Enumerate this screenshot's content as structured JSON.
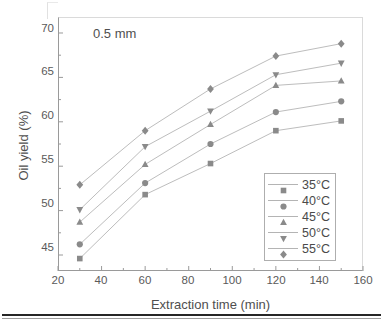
{
  "chart_data": {
    "type": "line",
    "title": "",
    "annotation": "0.5 mm",
    "xlabel": "Extraction time (min)",
    "ylabel": "Oil yield (%)",
    "xlim": [
      20,
      160
    ],
    "ylim": [
      43.2,
      71.8
    ],
    "xticks": [
      20,
      40,
      60,
      80,
      100,
      120,
      140,
      160
    ],
    "yticks": [
      45,
      50,
      55,
      60,
      65,
      70
    ],
    "xminor_step": 10,
    "yminor_step": 2.5,
    "grid": false,
    "legend_position": "lower right",
    "x": [
      30,
      60,
      90,
      120,
      150
    ],
    "series": [
      {
        "name": "35°C",
        "marker": "square",
        "color": "#8a8a8a",
        "values": [
          44.6,
          51.8,
          55.3,
          59.0,
          60.1
        ]
      },
      {
        "name": "40°C",
        "marker": "circle",
        "color": "#8a8a8a",
        "values": [
          46.2,
          53.1,
          57.5,
          61.1,
          62.3
        ]
      },
      {
        "name": "45°C",
        "marker": "triangle-up",
        "color": "#8a8a8a",
        "values": [
          48.7,
          55.2,
          59.7,
          64.1,
          64.6
        ]
      },
      {
        "name": "50°C",
        "marker": "triangle-down",
        "color": "#8a8a8a",
        "values": [
          50.1,
          57.2,
          61.2,
          65.3,
          66.6
        ]
      },
      {
        "name": "55°C",
        "marker": "diamond",
        "color": "#8a8a8a",
        "values": [
          52.9,
          59.0,
          63.7,
          67.4,
          68.8
        ]
      }
    ]
  },
  "axes": {
    "x_tick_labels": [
      "20",
      "40",
      "60",
      "80",
      "100",
      "120",
      "140",
      "160"
    ],
    "y_tick_labels": [
      "45",
      "50",
      "55",
      "60",
      "65",
      "70"
    ],
    "x_title": "Extraction time (min)",
    "y_title": "Oil yield (%)"
  },
  "legend": {
    "entries": [
      {
        "label": "35°C",
        "marker": "square"
      },
      {
        "label": "40°C",
        "marker": "circle"
      },
      {
        "label": "45°C",
        "marker": "triangle-up"
      },
      {
        "label": "50°C",
        "marker": "triangle-down"
      },
      {
        "label": "55°C",
        "marker": "diamond"
      }
    ]
  },
  "annotation": {
    "text": "0.5 mm"
  },
  "colors": {
    "marker": "#8a8a8a",
    "line": "#bdbdbd",
    "axis": "#9a9a9a",
    "text": "#4f4f4f",
    "rule": "#262626"
  }
}
